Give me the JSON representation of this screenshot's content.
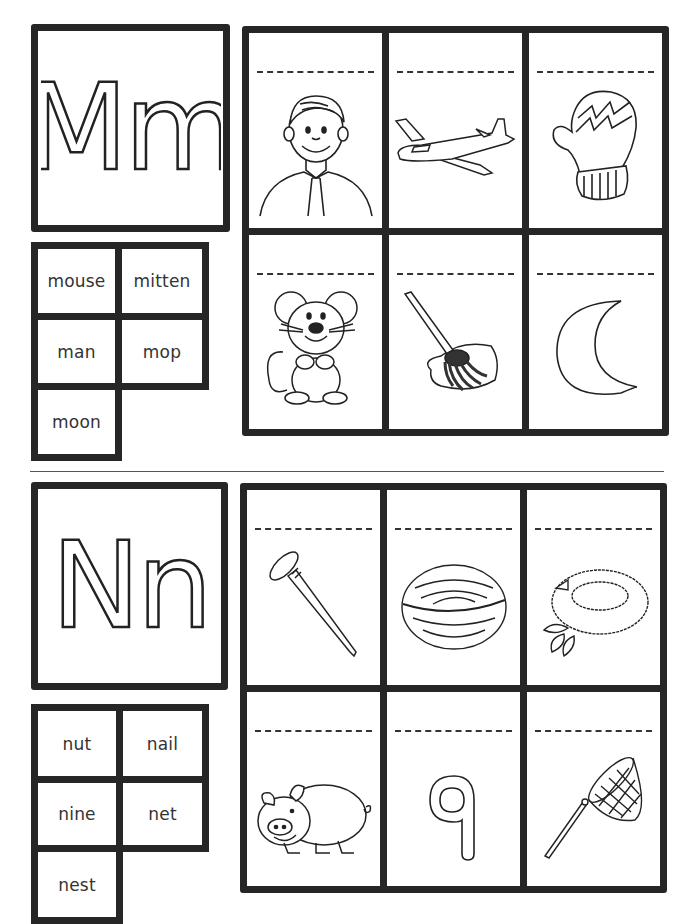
{
  "worksheet": {
    "sections": [
      {
        "letter": "Mm",
        "words": [
          "mouse",
          "mitten",
          "man",
          "mop",
          "moon"
        ],
        "pictures": [
          "man",
          "airplane",
          "mitten",
          "mouse",
          "mop",
          "moon"
        ]
      },
      {
        "letter": "Nn",
        "words": [
          "nut",
          "nail",
          "nine",
          "net",
          "nest"
        ],
        "pictures": [
          "nail",
          "nut",
          "nest",
          "pig",
          "nine",
          "net"
        ]
      }
    ]
  }
}
